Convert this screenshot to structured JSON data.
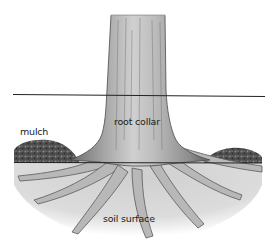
{
  "diagram": {
    "labels": {
      "mulch": "mulch",
      "root_collar": "root collar",
      "soil_surface": "soil surface"
    },
    "reference_lines": [
      {
        "name": "root-collar-line",
        "y": 95
      },
      {
        "name": "soil-line",
        "y": 163
      }
    ],
    "colors": {
      "background": "#ffffff",
      "bark_light": "#d8d8d8",
      "bark_mid": "#9a9a9a",
      "bark_dark": "#555555",
      "mulch": "#4a4a4a",
      "soil": "#c8c8c8",
      "line": "#222222"
    }
  }
}
